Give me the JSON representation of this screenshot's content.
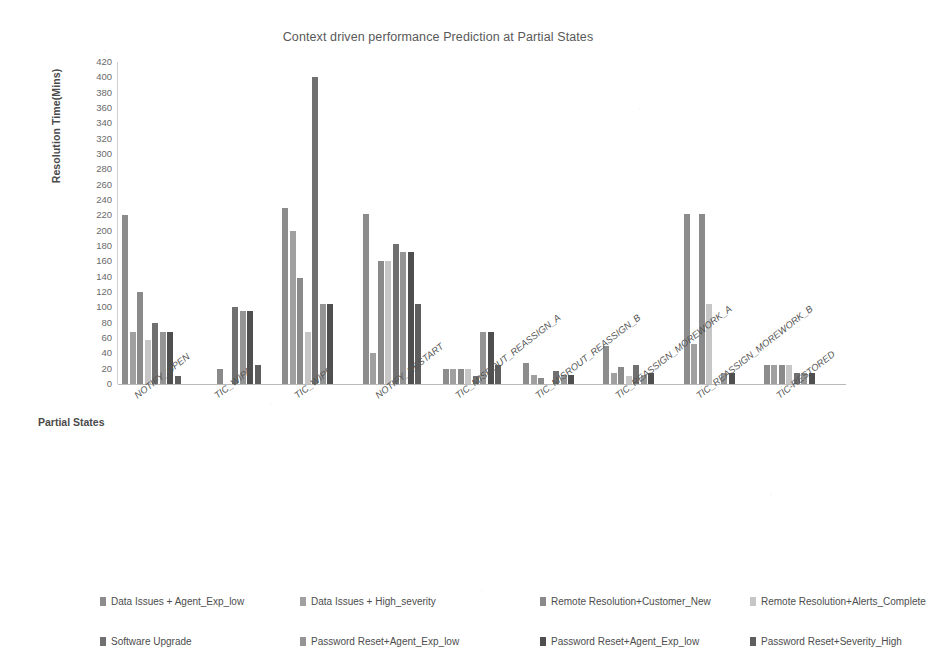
{
  "chart_data": {
    "type": "bar",
    "title": "Context driven performance Prediction at Partial States",
    "xlabel": "Partial States",
    "ylabel": "Resolution Time(Mins)",
    "ylim": [
      0,
      420
    ],
    "ytick_step": 20,
    "yticks": [
      "0",
      "20",
      "40",
      "60",
      "80",
      "100",
      "120",
      "140",
      "160",
      "180",
      "200",
      "220",
      "240",
      "260",
      "280",
      "300",
      "320",
      "340",
      "360",
      "380",
      "400",
      "420"
    ],
    "grid": false,
    "legend_position": "bottom",
    "categories": [
      "NOTIFY_OPEN",
      "TIC_WIPA",
      "TIC_WIPB",
      "NOTIFY_RESTART",
      "TIC_MISROUT_REASSIGN_A",
      "TIC_MISROUT_REASSIGN_B",
      "TIC_REASSIGN_MOREWORK_A",
      "TIC_REASSIGN_MOREWORK_B",
      "TIC-RESTORED"
    ],
    "series": [
      {
        "name": "Data Issues + Agent_Exp_low",
        "color": "#8c8c8c",
        "values": [
          220,
          0,
          230,
          222,
          20,
          28,
          50,
          222,
          25
        ]
      },
      {
        "name": "Data Issues + High_severity",
        "color": "#a0a0a0",
        "values": [
          68,
          0,
          200,
          40,
          20,
          12,
          14,
          52,
          25
        ]
      },
      {
        "name": "Remote Resolution+Customer_New",
        "color": "#8a8a8a",
        "values": [
          120,
          20,
          138,
          160,
          20,
          8,
          22,
          222,
          25
        ]
      },
      {
        "name": "Remote Resolution+Alerts_Complete",
        "color": "#c6c6c6",
        "values": [
          58,
          0,
          68,
          160,
          20,
          0,
          10,
          105,
          25
        ]
      },
      {
        "name": "Software Upgrade",
        "color": "#707070",
        "values": [
          80,
          100,
          400,
          183,
          10,
          17,
          25,
          0,
          14
        ]
      },
      {
        "name": "Password Reset+Agent_Exp_low",
        "color": "#959595",
        "values": [
          68,
          95,
          105,
          172,
          68,
          12,
          12,
          14,
          14
        ]
      },
      {
        "name": "Password Reset+Agent_Exp_low",
        "color": "#4f4f4f",
        "values": [
          68,
          95,
          105,
          172,
          68,
          12,
          14,
          14,
          14
        ]
      },
      {
        "name": "Password Reset+Severity_High",
        "color": "#5e5e5e",
        "values": [
          10,
          25,
          0,
          105,
          25,
          0,
          0,
          0,
          0
        ]
      }
    ]
  }
}
